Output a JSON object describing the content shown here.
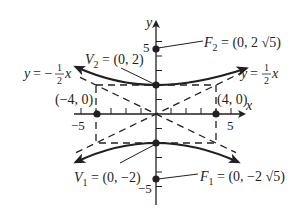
{
  "diagram": {
    "type": "hyperbola",
    "equation": "y^2/4 - x^2/16 = 1",
    "colors": {
      "ink": "#231f20",
      "background": "#ffffff"
    },
    "axes": {
      "x_label": "x",
      "y_label": "y",
      "tick_labels": {
        "x_neg": "−5",
        "x_pos": "5",
        "y_pos": "5",
        "y_neg": "−5"
      }
    },
    "asymptotes": {
      "positive": {
        "prefix": "y = ",
        "num": "1",
        "den": "2",
        "suffix": "x"
      },
      "negative": {
        "prefix": "y = −",
        "num": "1",
        "den": "2",
        "suffix": "x"
      }
    },
    "points": {
      "v2": {
        "name": "V",
        "sub": "2",
        "value": " = (0, 2)"
      },
      "v1": {
        "name": "V",
        "sub": "1",
        "value": " = (0, −2)"
      },
      "f2": {
        "name": "F",
        "sub": "2",
        "value": " = (0, 2 √5)"
      },
      "f1": {
        "name": "F",
        "sub": "1",
        "value": " = (0, −2 √5)"
      },
      "left": {
        "label": "(−4, 0)"
      },
      "right": {
        "label": "(4, 0)"
      }
    }
  }
}
